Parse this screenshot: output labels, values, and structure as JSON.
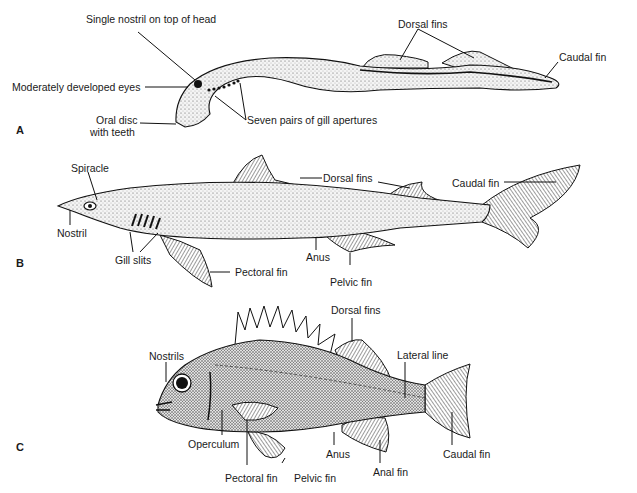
{
  "figure": {
    "panels": [
      {
        "id": "A",
        "letter": "A",
        "labels": {
          "nostril": "Single nostril on top of head",
          "eyes": "Moderately developed eyes",
          "oral_disc_line1": "Oral disc",
          "oral_disc_line2": "with teeth",
          "gill": "Seven pairs of gill apertures",
          "dorsal": "Dorsal fins",
          "caudal": "Caudal fin"
        }
      },
      {
        "id": "B",
        "letter": "B",
        "labels": {
          "spiracle": "Spiracle",
          "nostril": "Nostril",
          "gill": "Gill slits",
          "pectoral": "Pectoral fin",
          "dorsal": "Dorsal fins",
          "anus": "Anus",
          "pelvic": "Pelvic fin",
          "caudal": "Caudal fin"
        }
      },
      {
        "id": "C",
        "letter": "C",
        "labels": {
          "nostrils": "Nostrils",
          "operculum": "Operculum",
          "pectoral": "Pectoral fin",
          "pelvic": "Pelvic fin",
          "dorsal": "Dorsal fins",
          "lateral": "Lateral line",
          "anus": "Anus",
          "anal": "Anal fin",
          "caudal": "Caudal fin"
        }
      }
    ]
  }
}
